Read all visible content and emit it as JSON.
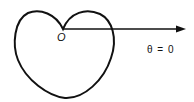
{
  "diagram": {
    "type": "polar-curve",
    "origin_label": "O",
    "axis_label": "θ = 0",
    "colors": {
      "stroke": "#111111",
      "background": "#ffffff"
    }
  }
}
